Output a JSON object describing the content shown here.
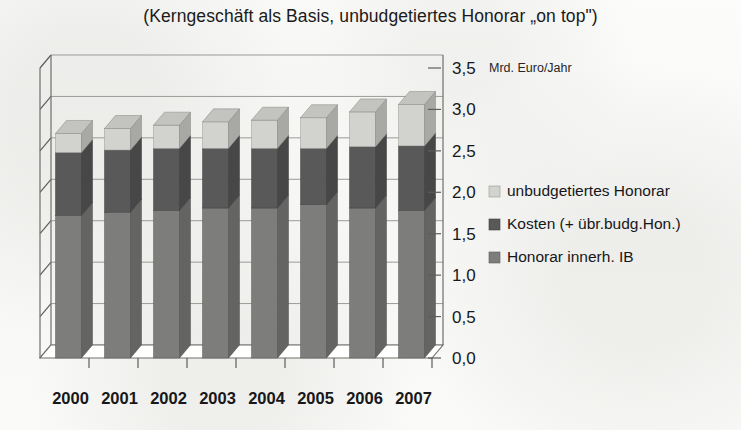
{
  "chart_title": "(Kerngeschäft als Basis, unbudgetiertes Honorar „on top\")",
  "axis_unit_label": "Mrd. Euro/Jahr",
  "legend": {
    "items": [
      {
        "label": "unbudgetiertes Honorar",
        "color": "#d2d2ce",
        "marker": "square-swatch"
      },
      {
        "label": "Kosten (+ übr.budg.Hon.)",
        "color": "#59595a",
        "marker": "square-swatch"
      },
      {
        "label": "Honorar innerh. IB",
        "color": "#7d7d7c",
        "marker": "square-swatch"
      }
    ]
  },
  "y_ticks": [
    "0,0",
    "0,5",
    "1,0",
    "1,5",
    "2,0",
    "2,5",
    "3,0",
    "3,5"
  ],
  "x_labels": [
    "2000",
    "2001",
    "2002",
    "2003",
    "2004",
    "2005",
    "2006",
    "2007"
  ],
  "chart_data": {
    "type": "bar",
    "stacked": true,
    "three_d": true,
    "title": "(Kerngeschäft als Basis, unbudgetiertes Honorar „on top\")",
    "xlabel": "",
    "ylabel": "Mrd. Euro/Jahr",
    "ylim": [
      0.0,
      3.5
    ],
    "ytick_step": 0.5,
    "ytick_values": [
      0.0,
      0.5,
      1.0,
      1.5,
      2.0,
      2.5,
      3.0,
      3.5
    ],
    "ytick_labels": [
      "0,0",
      "0,5",
      "1,0",
      "1,5",
      "2,0",
      "2,5",
      "3,0",
      "3,5"
    ],
    "grid": true,
    "legend_position": "right",
    "categories": [
      "2000",
      "2001",
      "2002",
      "2003",
      "2004",
      "2005",
      "2006",
      "2007"
    ],
    "series": [
      {
        "name": "Honorar innerh. IB",
        "color": "#7d7d7c",
        "values": [
          1.72,
          1.76,
          1.78,
          1.81,
          1.81,
          1.85,
          1.81,
          1.78
        ]
      },
      {
        "name": "Kosten (+ übr.budg.Hon.)",
        "color": "#59595a",
        "values": [
          0.76,
          0.75,
          0.75,
          0.72,
          0.72,
          0.68,
          0.74,
          0.78
        ]
      },
      {
        "name": "unbudgetiertes Honorar",
        "color": "#d2d2ce",
        "values": [
          0.23,
          0.26,
          0.28,
          0.32,
          0.34,
          0.37,
          0.42,
          0.5
        ]
      }
    ],
    "totals": [
      2.71,
      2.77,
      2.81,
      2.85,
      2.87,
      2.9,
      2.97,
      3.06
    ],
    "cumulative_boundaries": [
      {
        "category": "2000",
        "honorar_top": 1.72,
        "kosten_top": 2.48,
        "total": 2.71
      },
      {
        "category": "2001",
        "honorar_top": 1.76,
        "kosten_top": 2.51,
        "total": 2.77
      },
      {
        "category": "2002",
        "honorar_top": 1.78,
        "kosten_top": 2.53,
        "total": 2.81
      },
      {
        "category": "2003",
        "honorar_top": 1.81,
        "kosten_top": 2.53,
        "total": 2.85
      },
      {
        "category": "2004",
        "honorar_top": 1.81,
        "kosten_top": 2.53,
        "total": 2.87
      },
      {
        "category": "2005",
        "honorar_top": 1.85,
        "kosten_top": 2.53,
        "total": 2.9
      },
      {
        "category": "2006",
        "honorar_top": 1.81,
        "kosten_top": 2.55,
        "total": 2.97
      },
      {
        "category": "2007",
        "honorar_top": 1.78,
        "kosten_top": 2.56,
        "total": 3.06
      }
    ]
  }
}
